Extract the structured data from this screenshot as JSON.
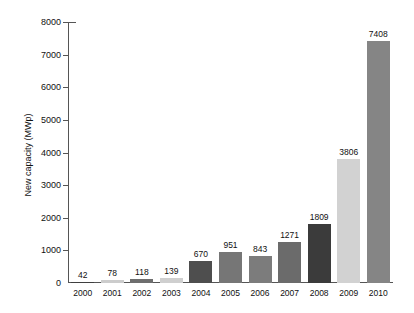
{
  "chart_data": {
    "type": "bar",
    "title": "",
    "subtitle": "",
    "xlabel": "",
    "ylabel": "New capacity (MWp)",
    "categories": [
      "2000",
      "2001",
      "2002",
      "2003",
      "2004",
      "2005",
      "2006",
      "2007",
      "2008",
      "2009",
      "2010"
    ],
    "values": [
      42,
      78,
      118,
      139,
      670,
      951,
      843,
      1271,
      1809,
      3806,
      7408
    ],
    "value_labels": [
      "42",
      "78",
      "118",
      "139",
      "670",
      "951",
      "843",
      "1271",
      "1809",
      "3806",
      "7408"
    ],
    "ylim": [
      0,
      8000
    ],
    "yticks": [
      0,
      1000,
      2000,
      3000,
      4000,
      5000,
      6000,
      7000,
      8000
    ],
    "ytick_labels": [
      "0",
      "1000",
      "2000",
      "3000",
      "4000",
      "5000",
      "6000",
      "7000",
      "8000"
    ],
    "grid": false,
    "legend": "none",
    "bar_colors": [
      "#3f3f3f",
      "#cccccc",
      "#6e6e6e",
      "#cfcfcf",
      "#4e4e4e",
      "#767676",
      "#7c7c7c",
      "#6b6b6b",
      "#3b3b3b",
      "#d2d2d2",
      "#858585"
    ],
    "axis_color": "#555555",
    "text_color": "#111111",
    "background": "#ffffff"
  }
}
